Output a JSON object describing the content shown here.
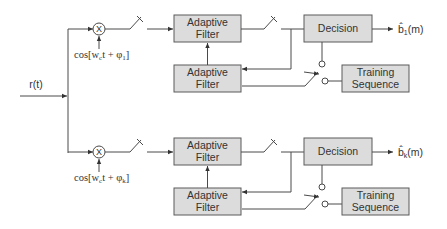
{
  "diagram": {
    "type": "block-diagram",
    "title": "",
    "input": {
      "label": "r(t)"
    },
    "branches": [
      {
        "id": "branch-1",
        "mixer_symbol": "X",
        "carrier_label": "cos[w",
        "carrier_sub": "c",
        "carrier_rest": "t + φ",
        "carrier_phase_sub": "1",
        "carrier_close": "]",
        "adaptive_filter_top": [
          "Adaptive",
          "Filter"
        ],
        "adaptive_filter_bottom": [
          "Adaptive",
          "Filter"
        ],
        "decision": "Decision",
        "training": [
          "Training",
          "Sequence"
        ],
        "output_hat": "b̂",
        "output_sub": "1",
        "output_rest": "(m)"
      },
      {
        "id": "branch-k",
        "mixer_symbol": "X",
        "carrier_label": "cos[w",
        "carrier_sub": "c",
        "carrier_rest": "t + φ",
        "carrier_phase_sub": "k",
        "carrier_close": "]",
        "adaptive_filter_top": [
          "Adaptive",
          "Filter"
        ],
        "adaptive_filter_bottom": [
          "Adaptive",
          "Filter"
        ],
        "decision": "Decision",
        "training": [
          "Training",
          "Sequence"
        ],
        "output_hat": "b̂",
        "output_sub": "k",
        "output_rest": "(m)"
      }
    ],
    "colors": {
      "box_fill": "#dcdcdc",
      "box_stroke": "#5a5a5a",
      "line": "#4a4a4a",
      "text": "#333333"
    }
  }
}
